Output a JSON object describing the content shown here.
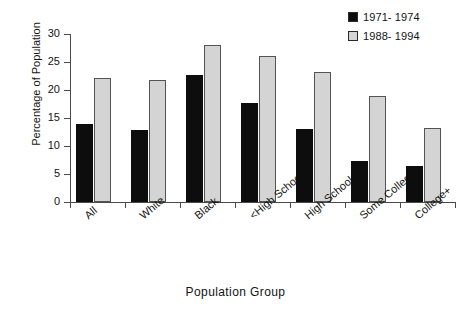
{
  "chart_data": {
    "type": "bar",
    "title": "",
    "xlabel": "Population Group",
    "ylabel": "Percentage of Population",
    "ylim": [
      0,
      30
    ],
    "yticks": [
      0,
      5,
      10,
      15,
      20,
      25,
      30
    ],
    "ytick_labels": [
      "0",
      "5",
      "10",
      "15",
      "20",
      "25",
      "30"
    ],
    "grid": false,
    "legend_position": "top-right",
    "categories": [
      "All",
      "White",
      "Black",
      "<High School",
      "High School",
      "Some College",
      "College+"
    ],
    "series": [
      {
        "name": "1971- 1974",
        "color": "#0d0d0d",
        "values": [
          13.9,
          12.8,
          22.7,
          17.7,
          13.0,
          7.4,
          6.5
        ]
      },
      {
        "name": "1988- 1994",
        "color": "#d4d4d4",
        "values": [
          22.2,
          21.8,
          28.0,
          26.1,
          23.3,
          19.0,
          13.2
        ]
      }
    ]
  },
  "legend": {
    "entries": [
      {
        "label": "1971- 1974",
        "swatch": "legend-swatch-1971-1974"
      },
      {
        "label": "1988- 1994",
        "swatch": "legend-swatch-1988-1994"
      }
    ]
  }
}
